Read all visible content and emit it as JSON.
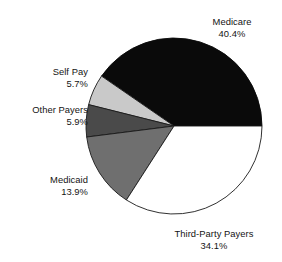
{
  "figure": {
    "type": "pie-chart-figure",
    "background_color": "#ffffff"
  },
  "chart_data": {
    "type": "pie",
    "title": "",
    "subtitle": "",
    "xlabel": "",
    "ylabel": "",
    "legend_position": "none",
    "grid": false,
    "labels_outside": true,
    "units": "percent",
    "start_angle_deg": 0,
    "direction": "counterclockwise",
    "total": 100.0,
    "categories": [
      "Medicare",
      "Self Pay",
      "Other Payers",
      "Medicaid",
      "Third-Party Payers"
    ],
    "values": [
      40.4,
      5.7,
      5.9,
      13.9,
      34.1
    ],
    "colors": [
      "#0a0a0a",
      "#c9c9c9",
      "#4a4a4a",
      "#6f6f6f",
      "#ffffff"
    ],
    "slices": [
      {
        "name": "Medicare",
        "value": 40.4,
        "value_text": "40.4%",
        "color": "#0a0a0a",
        "stroke": "#0a0a0a",
        "start_deg": 0.0,
        "end_deg": 145.44
      },
      {
        "name": "Self Pay",
        "value": 5.7,
        "value_text": "5.7%",
        "color": "#c9c9c9",
        "stroke": "#1a1a1a",
        "start_deg": 145.44,
        "end_deg": 165.96
      },
      {
        "name": "Other Payers",
        "value": 5.9,
        "value_text": "5.9%",
        "color": "#4a4a4a",
        "stroke": "#1a1a1a",
        "start_deg": 165.96,
        "end_deg": 187.2
      },
      {
        "name": "Medicaid",
        "value": 13.9,
        "value_text": "13.9%",
        "color": "#6f6f6f",
        "stroke": "#1a1a1a",
        "start_deg": 187.2,
        "end_deg": 237.24
      },
      {
        "name": "Third-Party Payers",
        "value": 34.1,
        "value_text": "34.1%",
        "color": "#ffffff",
        "stroke": "#1a1a1a",
        "start_deg": 237.24,
        "end_deg": 360.0
      }
    ]
  },
  "labels": {
    "medicare": {
      "name": "Medicare",
      "percent": "40.4%"
    },
    "self_pay": {
      "name": "Self Pay",
      "percent": "5.7%"
    },
    "other_payers": {
      "name": "Other Payers",
      "percent": "5.9%"
    },
    "medicaid": {
      "name": "Medicaid",
      "percent": "13.9%"
    },
    "third_party_payers": {
      "name": "Third-Party Payers",
      "percent": "34.1%"
    }
  },
  "geometry": {
    "center_x": 174,
    "center_y": 126,
    "radius": 88
  }
}
